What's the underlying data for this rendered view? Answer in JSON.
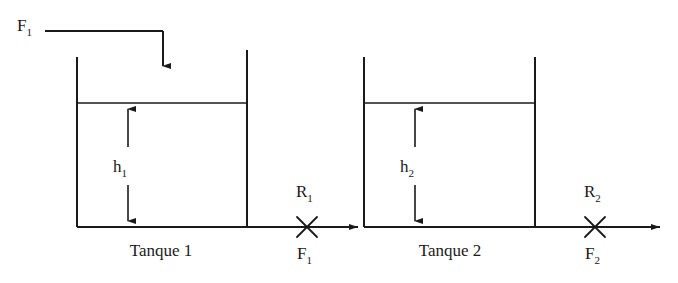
{
  "diagram": {
    "language": "pt",
    "stroke_color": "#1a1a1a",
    "background_color": "#ffffff",
    "labels": {
      "inlet_flow": "F",
      "inlet_flow_sub": "1",
      "tank1_level": "h",
      "tank1_level_sub": "1",
      "tank1_name": "Tanque 1",
      "valve1_resistance": "R",
      "valve1_resistance_sub": "1",
      "valve1_flow": "F",
      "valve1_flow_sub": "1",
      "tank2_level": "h",
      "tank2_level_sub": "2",
      "tank2_name": "Tanque 2",
      "valve2_resistance": "R",
      "valve2_resistance_sub": "2",
      "valve2_flow": "F",
      "valve2_flow_sub": "2"
    },
    "elements": {
      "tank1": {
        "left_wall_x": 77,
        "right_wall_x": 247,
        "top_y": 57,
        "bottom_y": 227,
        "water_level_y": 103
      },
      "tank2": {
        "left_wall_x": 364,
        "right_wall_x": 535,
        "top_y": 57,
        "bottom_y": 227,
        "water_level_y": 103
      },
      "inlet_pipe": {
        "start_x": 45,
        "y": 31,
        "elbow_x": 163,
        "arrow_tip_y": 75
      },
      "valve1_x": 307,
      "valve2_x": 595,
      "outlet_arrow_end_x": 660
    }
  }
}
